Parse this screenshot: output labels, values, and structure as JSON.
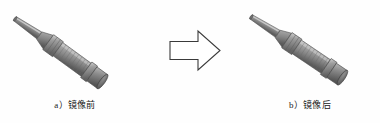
{
  "figure": {
    "background_color": "#fefefe",
    "watermark_text": "",
    "panels": [
      {
        "id": "before",
        "caption_label": "a）",
        "caption_text": "镜像前",
        "object_name": "圆柱形接近传感器",
        "object_description": "带电缆的圆柱形螺纹接近开关传感器（原始方向）",
        "mirrored": false
      },
      {
        "id": "after",
        "caption_label": "b）",
        "caption_text": "镜像后",
        "object_name": "圆柱形接近传感器",
        "object_description": "带电缆的圆柱形螺纹接近开关传感器（镜像后方向）",
        "mirrored": true
      }
    ],
    "arrow": {
      "name": "block-arrow-right",
      "direction": "right",
      "fill_color": "#ffffff",
      "stroke_color": "#3a3a3a"
    },
    "colors": {
      "body_mid": "#8d8d8d",
      "body_light": "#c9c9c9",
      "body_dark": "#5f5f5f",
      "body_darkest": "#474747",
      "outline": "#4a4a4a",
      "caption": "#1a1a1a"
    }
  }
}
